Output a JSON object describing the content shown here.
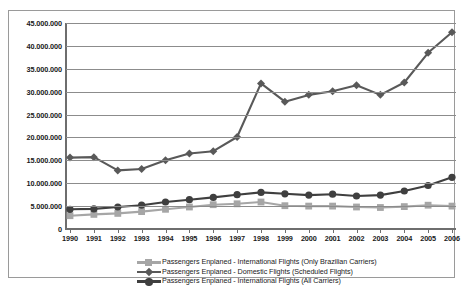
{
  "chart_data": {
    "type": "line",
    "title": "",
    "xlabel": "",
    "ylabel": "",
    "grid": true,
    "legend_position": "bottom",
    "xlim": [
      1990,
      2006
    ],
    "ylim": [
      0,
      45000000
    ],
    "y_tick_step": 5000000,
    "categories": [
      1990,
      1991,
      1992,
      1993,
      1994,
      1995,
      1996,
      1997,
      1998,
      1999,
      2000,
      2001,
      2002,
      2003,
      2004,
      2005,
      2006
    ],
    "x_tick_labels": [
      "1990",
      "1991",
      "1992",
      "1993",
      "1994",
      "1995",
      "1996",
      "1997",
      "1998",
      "1999",
      "2000",
      "2001",
      "2002",
      "2003",
      "2004",
      "2005",
      "2006"
    ],
    "y_tick_labels": [
      "0",
      "5.000.000",
      "10.000.000",
      "15.000.000",
      "20.000.000",
      "25.000.000",
      "30.000.000",
      "35.000.000",
      "40.000.000",
      "45.000.000"
    ],
    "y_tick_values": [
      0,
      5000000,
      10000000,
      15000000,
      20000000,
      25000000,
      30000000,
      35000000,
      40000000,
      45000000
    ],
    "series": [
      {
        "name": "Passengers Enplaned - International Flights (Only Brazilian Carriers)",
        "key": "intl-brazilian",
        "color": "#a6a6a6",
        "marker": "square",
        "values": [
          2900000,
          3200000,
          3400000,
          3800000,
          4300000,
          4800000,
          5300000,
          5500000,
          5900000,
          5100000,
          5000000,
          5000000,
          4800000,
          4700000,
          4900000,
          5200000,
          5000000
        ]
      },
      {
        "name": "Passengers Enplaned - Domestic Flights (Scheduled Flights)",
        "key": "domestic",
        "color": "#595959",
        "marker": "diamond",
        "values": [
          15600000,
          15700000,
          12800000,
          13100000,
          15000000,
          16500000,
          17000000,
          20100000,
          31800000,
          27800000,
          29300000,
          30100000,
          31400000,
          29300000,
          32000000,
          38500000,
          43000000
        ]
      },
      {
        "name": "Passengers Enplaned - International Flights (All Carriers)",
        "key": "intl-all",
        "color": "#3f3f3f",
        "marker": "circle",
        "values": [
          4300000,
          4400000,
          4800000,
          5200000,
          5900000,
          6400000,
          6900000,
          7500000,
          8000000,
          7700000,
          7400000,
          7600000,
          7200000,
          7400000,
          8300000,
          9500000,
          11300000
        ]
      }
    ]
  },
  "legend": {
    "items": [
      {
        "label": "Passengers Enplaned - International Flights (Only Brazilian Carriers)",
        "marker": "square",
        "color": "#a6a6a6"
      },
      {
        "label": "Passengers Enplaned - Domestic Flights (Scheduled Flights)",
        "marker": "diamond",
        "color": "#595959"
      },
      {
        "label": "Passengers Enplaned - International Flights (All Carriers)",
        "marker": "circle",
        "color": "#3f3f3f"
      }
    ]
  }
}
